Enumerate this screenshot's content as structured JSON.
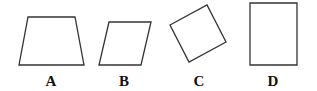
{
  "figure": {
    "shapes": [
      {
        "label": "A",
        "kind": "trapezoid",
        "points": "28,17 75,17 84,65 19,65",
        "label_x": 51
      },
      {
        "label": "B",
        "kind": "parallelogram",
        "points": "109,22 151,22 141,65 99,65",
        "label_x": 124
      },
      {
        "label": "C",
        "kind": "rotated-square",
        "points": "170,25 207,5 226,42 189,62",
        "label_x": 199
      },
      {
        "label": "D",
        "kind": "rectangle",
        "points": "250,3 297,3 297,65 250,65",
        "label_x": 273
      }
    ],
    "label_y": 86,
    "stroke_color": "#333333"
  }
}
